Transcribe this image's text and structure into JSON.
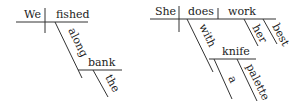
{
  "diagrams": [
    {
      "sentence": "We fished along the bank",
      "subject": "We",
      "verb": "fished",
      "preposition": "along",
      "object_of_preposition": "bank",
      "article": "the"
    },
    {
      "sentence": "She does her best work with a palette knife",
      "subject": "She",
      "verb": "does",
      "direct_object": "work",
      "modifiers_object": [
        "her",
        "best"
      ],
      "preposition": "with",
      "object_of_preposition": "knife",
      "modifiers_prep_object": [
        "a",
        "palette"
      ]
    }
  ],
  "colors": {
    "line": "#333333",
    "text": "#222222",
    "background": "#ffffff"
  }
}
